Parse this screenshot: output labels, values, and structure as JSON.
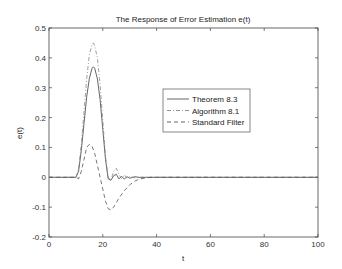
{
  "chart_data": {
    "type": "line",
    "title": "The Response of Error Estimation e(t)",
    "xlabel": "t",
    "ylabel": "e(t)",
    "xlim": [
      0,
      100
    ],
    "ylim": [
      -0.2,
      0.5
    ],
    "xticks": [
      0,
      20,
      40,
      60,
      80,
      100
    ],
    "yticks": [
      -0.2,
      -0.1,
      0,
      0.1,
      0.2,
      0.3,
      0.4,
      0.5
    ],
    "xtick_labels": [
      "0",
      "20",
      "40",
      "60",
      "80",
      "100"
    ],
    "ytick_labels": [
      "-0.2",
      "-0.1",
      "0",
      "0.1",
      "0.2",
      "0.3",
      "0.4",
      "0.5"
    ],
    "grid": false,
    "legend_position": "center-right",
    "series": [
      {
        "name": "Theorem 8.3",
        "style": "solid",
        "color": "#555555",
        "x": [
          0,
          10,
          11,
          12,
          13,
          14,
          15,
          16,
          16.5,
          17,
          18,
          19,
          20,
          21,
          22,
          23,
          24,
          25,
          26,
          27,
          28,
          29,
          30,
          32,
          34,
          36,
          40,
          50,
          100
        ],
        "y": [
          0,
          0,
          0.02,
          0.09,
          0.18,
          0.27,
          0.33,
          0.365,
          0.37,
          0.365,
          0.33,
          0.26,
          0.16,
          0.06,
          -0.005,
          -0.01,
          0.005,
          0.01,
          -0.005,
          0.003,
          -0.006,
          0.002,
          -0.003,
          0.002,
          -0.001,
          0,
          0,
          0,
          0
        ]
      },
      {
        "name": "Algorithm 8.1",
        "style": "dashdot",
        "color": "#888888",
        "x": [
          0,
          10,
          11,
          12,
          13,
          14,
          15,
          16,
          16.5,
          17,
          18,
          19,
          20,
          21,
          22,
          23,
          24,
          25,
          26,
          27,
          28,
          29,
          30,
          32,
          34,
          36,
          40,
          50,
          100
        ],
        "y": [
          0,
          0,
          0.03,
          0.11,
          0.22,
          0.33,
          0.41,
          0.445,
          0.45,
          0.44,
          0.4,
          0.31,
          0.19,
          0.07,
          0.0,
          -0.01,
          0.02,
          0.03,
          0.01,
          -0.005,
          0.008,
          -0.003,
          0.003,
          -0.002,
          0.001,
          0,
          0,
          0,
          0
        ]
      },
      {
        "name": "Standard Filter",
        "style": "dashed",
        "color": "#555555",
        "x": [
          0,
          10,
          11,
          12,
          13,
          14,
          15,
          16,
          17,
          18,
          19,
          20,
          21,
          22,
          23,
          24,
          25,
          26,
          28,
          30,
          32,
          34,
          36,
          38,
          40,
          50,
          100
        ],
        "y": [
          0,
          0,
          -0.005,
          0.02,
          0.06,
          0.1,
          0.11,
          0.105,
          0.08,
          0.04,
          0.0,
          -0.04,
          -0.08,
          -0.105,
          -0.11,
          -0.1,
          -0.085,
          -0.07,
          -0.045,
          -0.025,
          -0.012,
          -0.005,
          -0.002,
          0,
          0,
          0,
          0
        ]
      }
    ]
  }
}
